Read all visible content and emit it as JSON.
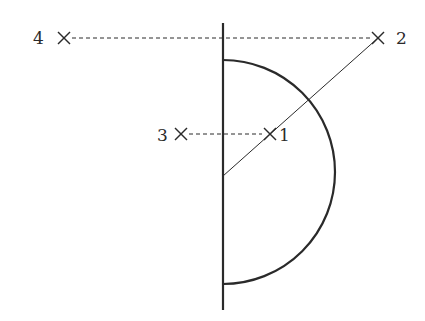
{
  "diagram": {
    "type": "geometric figure",
    "stroke_color": "#2a2a2a",
    "points": [
      {
        "label": "1",
        "x": 270,
        "y": 134,
        "label_side": "right"
      },
      {
        "label": "2",
        "x": 378,
        "y": 38,
        "label_side": "right"
      },
      {
        "label": "3",
        "x": 181,
        "y": 134,
        "label_side": "left"
      },
      {
        "label": "4",
        "x": 64,
        "y": 38,
        "label_side": "left"
      }
    ],
    "vertical_axis": {
      "x": 223,
      "y_top": 23,
      "y_bottom": 310
    },
    "semicircle": {
      "cx": 223,
      "cy": 172,
      "r": 112,
      "side": "right"
    },
    "dashed_lines": [
      {
        "from": "4",
        "to": "2"
      },
      {
        "from": "3",
        "to": "1"
      }
    ],
    "solid_line": {
      "from_x": 223,
      "from_y": 176,
      "to": "2",
      "passes_through": "1"
    }
  }
}
